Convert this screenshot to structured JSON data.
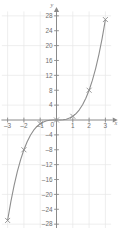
{
  "chart_data": {
    "type": "line",
    "title": "",
    "subtitle": "",
    "xlabel": "x",
    "ylabel": "y",
    "xlim": [
      -3.4,
      3.4
    ],
    "ylim": [
      -29.5,
      29.5
    ],
    "grid": true,
    "legend": "none",
    "x_ticks": [
      -3,
      -2,
      -1,
      0,
      1,
      2,
      3
    ],
    "x_tick_labels": [
      "-3",
      "-2",
      "-1",
      "0",
      "1",
      "2",
      "3"
    ],
    "y_ticks": [
      -28,
      -24,
      -20,
      -16,
      -12,
      -8,
      -4,
      4,
      8,
      12,
      16,
      20,
      24,
      28
    ],
    "y_tick_labels": [
      "-28",
      "-24",
      "-20",
      "-16",
      "-12",
      "-8",
      "-4",
      "4",
      "8",
      "12",
      "16",
      "20",
      "24",
      "28"
    ],
    "series": [
      {
        "name": "y = x^3",
        "curve_x": [
          -3,
          -2.8,
          -2.6,
          -2.4,
          -2.2,
          -2,
          -1.8,
          -1.6,
          -1.4,
          -1.2,
          -1,
          -0.8,
          -0.6,
          -0.4,
          -0.2,
          0,
          0.2,
          0.4,
          0.6,
          0.8,
          1,
          1.2,
          1.4,
          1.6,
          1.8,
          2,
          2.2,
          2.4,
          2.6,
          2.8,
          3
        ],
        "curve_y": [
          -27,
          -21.95,
          -17.58,
          -13.82,
          -10.65,
          -8,
          -5.83,
          -4.1,
          -2.74,
          -1.73,
          -1,
          -0.51,
          -0.22,
          -0.06,
          -0.01,
          0,
          0.01,
          0.06,
          0.22,
          0.51,
          1,
          1.73,
          2.74,
          4.1,
          5.83,
          8,
          10.65,
          13.82,
          17.58,
          21.95,
          27
        ],
        "marker_points": [
          {
            "x": -3,
            "y": -27
          },
          {
            "x": -2,
            "y": -8
          },
          {
            "x": -1,
            "y": -1
          },
          {
            "x": 0,
            "y": 0
          },
          {
            "x": 1,
            "y": 1
          },
          {
            "x": 2,
            "y": 8
          },
          {
            "x": 3,
            "y": 27
          }
        ],
        "marker": "x-cross",
        "color": "#8e8e8e"
      }
    ],
    "colors": {
      "curve": "#8e8e8e",
      "axis": "#8a8a8a",
      "grid": "#e8e8e8",
      "tick_text": "#6f6f6f",
      "background": "#ffffff"
    }
  }
}
